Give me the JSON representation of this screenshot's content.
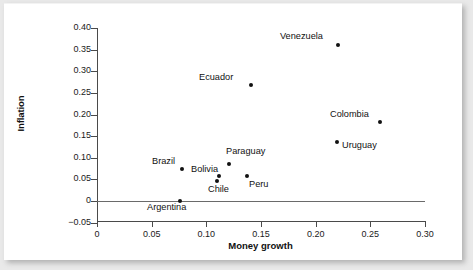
{
  "figure": {
    "background": "#ffffff",
    "page_background": "#e9e9e9"
  },
  "chart_data": {
    "type": "scatter",
    "title": "",
    "xlabel": "Money growth",
    "ylabel": "Inflation",
    "xlim": [
      0,
      0.3
    ],
    "ylim": [
      -0.05,
      0.4
    ],
    "grid": false,
    "legend": "none",
    "xticks": [
      "0",
      "0.05",
      "0.10",
      "0.15",
      "0.20",
      "0.25",
      "0.30"
    ],
    "xtick_values": [
      0,
      0.05,
      0.1,
      0.15,
      0.2,
      0.25,
      0.3
    ],
    "yticks": [
      "0.40",
      "0.35",
      "0.30",
      "0.25",
      "0.20",
      "0.15",
      "0.10",
      "0.05",
      "0",
      "−0.05"
    ],
    "ytick_values": [
      0.4,
      0.35,
      0.3,
      0.25,
      0.2,
      0.15,
      0.1,
      0.05,
      0,
      -0.05
    ],
    "zero_line": true,
    "points": [
      {
        "label": "Venezuela",
        "x": 0.221,
        "y": 0.361,
        "label_pos": "left"
      },
      {
        "label": "Ecuador",
        "x": 0.141,
        "y": 0.268,
        "label_pos": "left"
      },
      {
        "label": "Colombia",
        "x": 0.259,
        "y": 0.183,
        "label_pos": "left"
      },
      {
        "label": "Uruguay",
        "x": 0.22,
        "y": 0.136,
        "label_pos": "right"
      },
      {
        "label": "Paraguay",
        "x": 0.121,
        "y": 0.085,
        "label_pos": "above"
      },
      {
        "label": "Brazil",
        "x": 0.078,
        "y": 0.074,
        "label_pos": "left"
      },
      {
        "label": "Bolivia",
        "x": 0.111,
        "y": 0.053,
        "label_pos": "left-upper"
      },
      {
        "label": "Chile",
        "x": 0.108,
        "y": 0.048,
        "label_pos": "below"
      },
      {
        "label": "Peru",
        "x": 0.138,
        "y": 0.058,
        "label_pos": "below-right"
      },
      {
        "label": "Argentina",
        "x": 0.076,
        "y": 0.0,
        "label_pos": "below"
      }
    ]
  },
  "labels": {
    "Venezuela": {
      "left": 276,
      "top": 27
    },
    "Ecuador": {
      "left": 195,
      "top": 68
    },
    "Colombia": {
      "left": 326,
      "top": 105
    },
    "Uruguay": {
      "left": 338,
      "top": 136
    },
    "Paraguay": {
      "left": 222,
      "top": 142
    },
    "Brazil": {
      "left": 148,
      "top": 152
    },
    "Bolivia": {
      "left": 187,
      "top": 160
    },
    "Chile": {
      "left": 204,
      "top": 180
    },
    "Peru": {
      "left": 245,
      "top": 175
    },
    "Argentina": {
      "left": 143,
      "top": 198
    }
  },
  "point_px": {
    "Venezuela": {
      "x": 334,
      "y": 41
    },
    "Ecuador": {
      "x": 247,
      "y": 81
    },
    "Colombia": {
      "x": 376,
      "y": 118
    },
    "Uruguay": {
      "x": 333,
      "y": 138
    },
    "Paraguay": {
      "x": 225,
      "y": 160
    },
    "Brazil": {
      "x": 178,
      "y": 165
    },
    "Bolivia": {
      "x": 215,
      "y": 172
    },
    "Chile": {
      "x": 213,
      "y": 177
    },
    "Peru": {
      "x": 243,
      "y": 172
    },
    "Argentina": {
      "x": 176,
      "y": 197
    }
  }
}
